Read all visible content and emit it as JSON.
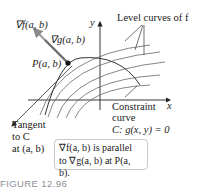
{
  "labels": {
    "grad_f": "∇f(a, b)",
    "grad_g": "∇g(a, b)",
    "point": "P(a, b)",
    "y_axis": "y",
    "x_axis": "x",
    "level_curves": "Level curves of f",
    "constraint_line1": "Constraint",
    "constraint_line2": "curve",
    "constraint_eq": "C: g(x, y) = 0",
    "tangent_line1": "Tangent",
    "tangent_line2": "to C",
    "tangent_line3": "at (a, b)"
  },
  "note": {
    "line1": "∇f(a, b) is parallel",
    "line2": "to ∇g(a, b) at P(a, b)."
  },
  "caption": "FIGURE 12.96",
  "colors": {
    "curve": "#555555",
    "constraint": "#333333",
    "arrow_f": "#9a9a9a",
    "arrow_g": "#6e6e6e",
    "caption": "#8a8f97"
  }
}
